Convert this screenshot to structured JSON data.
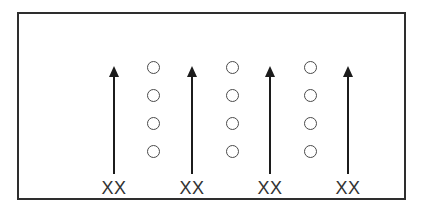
{
  "figure": {
    "background_color": "#ffffff",
    "frame_border_color": "#2e2e2e",
    "arrow_color": "#1c1c1c",
    "circle_stroke_color": "#4a4a4a",
    "label_color": "#333333",
    "arrows": [
      {
        "label": "XX"
      },
      {
        "label": "XX"
      },
      {
        "label": "XX"
      },
      {
        "label": "XX"
      }
    ],
    "circle_columns": 3,
    "circles_per_column": 4,
    "icons": {
      "arrow": "up-arrow-icon",
      "circle": "open-circle-icon"
    }
  }
}
